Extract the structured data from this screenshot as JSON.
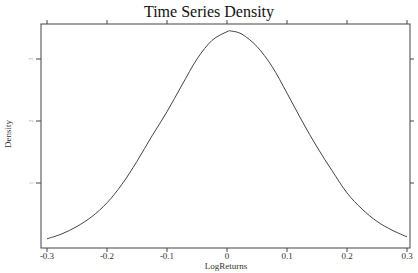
{
  "chart_data": {
    "type": "line",
    "title": "Time Series Density",
    "xlabel": "LogReturns",
    "ylabel": "Density",
    "xlim": [
      -0.31,
      0.31
    ],
    "ylim": [
      -0.05,
      3.55
    ],
    "x_ticks": [
      -0.3,
      -0.2,
      -0.1,
      0,
      0.1,
      0.2,
      0.3
    ],
    "x_tick_labels": [
      "-0.3",
      "-0.2",
      "-0.1",
      "0",
      "0.1",
      "0.2",
      "0.3"
    ],
    "y_ticks": [
      1,
      2,
      3
    ],
    "y_tick_labels": [
      "1",
      "2",
      "3"
    ],
    "grid": false,
    "legend": null,
    "series": [
      {
        "name": "density",
        "x": [
          -0.3,
          -0.275,
          -0.25,
          -0.225,
          -0.2,
          -0.175,
          -0.15,
          -0.125,
          -0.1,
          -0.075,
          -0.05,
          -0.025,
          0,
          0.007,
          0.025,
          0.05,
          0.075,
          0.1,
          0.125,
          0.15,
          0.175,
          0.2,
          0.225,
          0.25,
          0.275,
          0.3
        ],
        "values": [
          0.1,
          0.18,
          0.3,
          0.46,
          0.68,
          0.98,
          1.35,
          1.76,
          2.15,
          2.58,
          3.0,
          3.3,
          3.44,
          3.45,
          3.4,
          3.2,
          2.88,
          2.45,
          2.0,
          1.58,
          1.2,
          0.84,
          0.58,
          0.38,
          0.24,
          0.13
        ]
      }
    ]
  }
}
